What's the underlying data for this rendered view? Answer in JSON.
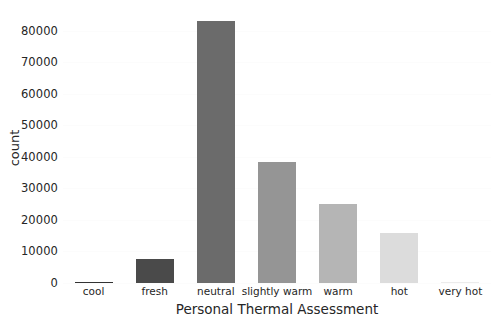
{
  "chart_data": {
    "type": "bar",
    "title": "",
    "xlabel": "Personal Thermal Assessment",
    "ylabel": "count",
    "categories": [
      "cool",
      "fresh",
      "neutral",
      "slightly warm",
      "warm",
      "hot",
      "very hot"
    ],
    "values": [
      400,
      7500,
      83000,
      38500,
      25000,
      16000,
      300
    ],
    "bar_colors": [
      "#333333",
      "#4a4a4a",
      "#6b6b6b",
      "#959595",
      "#b5b5b5",
      "#dcdcdc",
      "#ececec"
    ],
    "ylim": [
      0,
      86000
    ],
    "yticks": [
      0,
      10000,
      20000,
      30000,
      40000,
      50000,
      60000,
      70000,
      80000
    ],
    "ytick_labels": [
      "0",
      "10000",
      "20000",
      "30000",
      "40000",
      "50000",
      "60000",
      "70000",
      "80000"
    ],
    "grid": true,
    "grid_axis": "y",
    "grid_color": "#fcfcfc",
    "legend": null,
    "background": "#ffffff",
    "text_color": "#262626"
  }
}
